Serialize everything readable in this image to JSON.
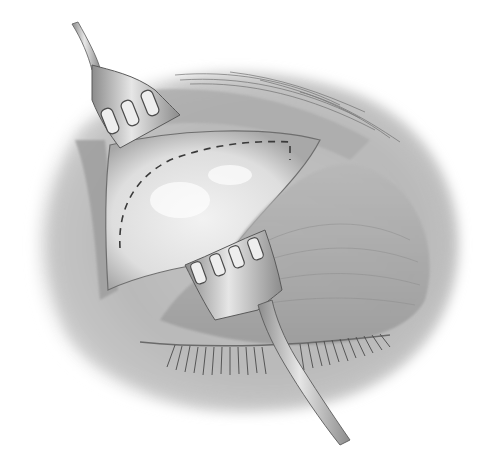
{
  "illustration": {
    "subject": "Surgical view of upper eyelid with two rake retractors",
    "style": "grayscale pencil shading",
    "palette": {
      "background": "#ffffff",
      "skin_light": "#d9d9d9",
      "skin_mid": "#b3b3b3",
      "skin_dark": "#7a7a7a",
      "tissue_light": "#ececec",
      "instrument": "#c8c8c8",
      "instrument_edge": "#5a5a5a",
      "dash_line": "#3a3a3a",
      "lash": "#4a4a4a"
    },
    "elements": [
      {
        "name": "upper-retractor",
        "prongs": 3,
        "position": "upper-left"
      },
      {
        "name": "lower-retractor",
        "prongs": 4,
        "position": "center-bottom"
      },
      {
        "name": "exposed-tissue",
        "position": "center"
      },
      {
        "name": "dashed-incision-line",
        "position": "upper-center"
      },
      {
        "name": "eyelashes",
        "position": "lower-center"
      },
      {
        "name": "brow-hair",
        "position": "upper-right"
      }
    ]
  }
}
